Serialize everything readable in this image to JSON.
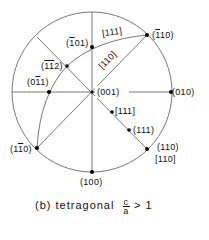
{
  "diagram": {
    "type": "stereographic-projection",
    "center": [
      92,
      92
    ],
    "radius": 80,
    "poles": [
      {
        "id": "p001",
        "label": "(001)",
        "x": 92,
        "y": 92
      },
      {
        "id": "p010",
        "label": "(010)",
        "x": 171,
        "y": 92
      },
      {
        "id": "p100",
        "label": "(100)",
        "x": 92,
        "y": 172
      },
      {
        "id": "pm110",
        "label_pre": "(",
        "label_bar": "1",
        "label_post": "10)",
        "x": 147,
        "y": 35
      },
      {
        "id": "p1m10",
        "label_pre": "(1",
        "label_bar": "1",
        "label_post": "0)",
        "x": 37,
        "y": 148
      },
      {
        "id": "p110",
        "label": "(110)",
        "x": 147,
        "y": 149
      },
      {
        "id": "pm101",
        "label_pre": "(",
        "label_bar": "1",
        "label_post": "01)",
        "x": 92,
        "y": 47
      },
      {
        "id": "pm1m12",
        "label_pre": "(",
        "label_bar": "11",
        "label_post": "2)",
        "x": 67,
        "y": 66
      },
      {
        "id": "p0m11",
        "label_pre": "(0",
        "label_bar": "1",
        "label_post": "1)",
        "x": 49,
        "y": 92
      },
      {
        "id": "d111",
        "label": "[111]",
        "x": 112,
        "y": 112
      },
      {
        "id": "p111",
        "label": "(111)",
        "x": 129,
        "y": 130
      }
    ],
    "direction_labels": {
      "arc_111": "[111]",
      "line_110": "[110]",
      "pole_110_direction": "[110]"
    }
  },
  "caption": {
    "prefix": "(b) tetragonal",
    "fraction_num": "c",
    "fraction_den": "a",
    "suffix": "> 1"
  }
}
